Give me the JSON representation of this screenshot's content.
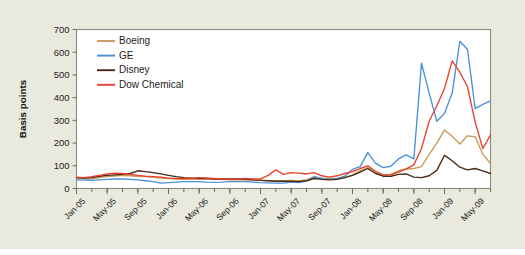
{
  "figure": {
    "background_color": "#e9e9dd",
    "plot_background_color": "#ffffff",
    "frame_color": "#8a8a80"
  },
  "chart_data": {
    "type": "line",
    "title": "",
    "xlabel": "",
    "ylabel": "Basis points",
    "ylim": [
      0,
      700
    ],
    "yticks": [
      0,
      100,
      200,
      300,
      400,
      500,
      600,
      700
    ],
    "ytick_labels": [
      "0",
      "100",
      "200",
      "300",
      "400",
      "500",
      "600",
      "700"
    ],
    "grid": false,
    "legend_position": "upper-left",
    "xtick_labels": [
      "Jan-05",
      "May-05",
      "Sep-05",
      "Jan-06",
      "May-06",
      "Sep-06",
      "Jan-07",
      "May-07",
      "Sep-07",
      "Jan-08",
      "May-08",
      "Sep-08",
      "Jan-09",
      "May-09"
    ],
    "xtick_indices": [
      0,
      4,
      8,
      12,
      16,
      20,
      24,
      28,
      32,
      36,
      40,
      44,
      48,
      52
    ],
    "x": [
      "Jan-05",
      "Feb-05",
      "Mar-05",
      "Apr-05",
      "May-05",
      "Jun-05",
      "Jul-05",
      "Aug-05",
      "Sep-05",
      "Oct-05",
      "Nov-05",
      "Dec-05",
      "Jan-06",
      "Feb-06",
      "Mar-06",
      "Apr-06",
      "May-06",
      "Jun-06",
      "Jul-06",
      "Aug-06",
      "Sep-06",
      "Oct-06",
      "Nov-06",
      "Dec-06",
      "Jan-07",
      "Feb-07",
      "Mar-07",
      "Apr-07",
      "May-07",
      "Jun-07",
      "Jul-07",
      "Aug-07",
      "Sep-07",
      "Oct-07",
      "Nov-07",
      "Dec-07",
      "Jan-08",
      "Feb-08",
      "Mar-08",
      "Apr-08",
      "May-08",
      "Jun-08",
      "Jul-08",
      "Aug-08",
      "Sep-08",
      "Oct-08",
      "Nov-08",
      "Dec-08",
      "Jan-09",
      "Feb-09",
      "Mar-09",
      "Apr-09",
      "May-09",
      "Jun-09",
      "Jul-09"
    ],
    "series": [
      {
        "name": "Boeing",
        "color": "#c99a5c",
        "values": [
          46,
          44,
          42,
          48,
          52,
          55,
          58,
          56,
          54,
          52,
          50,
          46,
          44,
          42,
          40,
          40,
          42,
          43,
          42,
          40,
          38,
          38,
          38,
          37,
          36,
          35,
          34,
          34,
          36,
          34,
          38,
          50,
          46,
          44,
          44,
          48,
          60,
          78,
          92,
          70,
          58,
          62,
          78,
          86,
          88,
          96,
          150,
          200,
          258,
          230,
          196,
          232,
          228,
          150,
          110
        ]
      },
      {
        "name": "GE",
        "color": "#4a90d9",
        "values": [
          38,
          37,
          36,
          38,
          40,
          42,
          42,
          40,
          38,
          34,
          30,
          24,
          26,
          28,
          30,
          30,
          30,
          28,
          27,
          28,
          30,
          30,
          30,
          28,
          26,
          25,
          24,
          24,
          28,
          26,
          34,
          52,
          44,
          40,
          44,
          54,
          84,
          96,
          158,
          112,
          92,
          98,
          130,
          148,
          130,
          552,
          420,
          296,
          330,
          420,
          648,
          612,
          352,
          370,
          386
        ]
      },
      {
        "name": "Disney",
        "color": "#4a2a14",
        "values": [
          48,
          46,
          48,
          54,
          58,
          60,
          62,
          66,
          78,
          74,
          70,
          64,
          58,
          52,
          48,
          46,
          44,
          44,
          42,
          42,
          42,
          42,
          40,
          38,
          36,
          34,
          32,
          32,
          32,
          30,
          34,
          44,
          40,
          38,
          40,
          48,
          58,
          72,
          88,
          66,
          54,
          54,
          62,
          64,
          50,
          48,
          56,
          80,
          146,
          122,
          94,
          82,
          88,
          78,
          66
        ]
      },
      {
        "name": "Dow Chemical",
        "color": "#e8412b",
        "values": [
          50,
          48,
          52,
          58,
          64,
          68,
          66,
          62,
          58,
          54,
          52,
          50,
          46,
          44,
          44,
          44,
          48,
          46,
          44,
          42,
          40,
          42,
          44,
          42,
          42,
          58,
          82,
          62,
          70,
          68,
          64,
          70,
          56,
          50,
          56,
          66,
          74,
          88,
          100,
          76,
          60,
          60,
          72,
          86,
          104,
          176,
          296,
          364,
          440,
          562,
          512,
          448,
          292,
          176,
          236
        ]
      }
    ]
  },
  "legend": {
    "items": [
      {
        "label": "Boeing",
        "color": "#c99a5c"
      },
      {
        "label": "GE",
        "color": "#4a90d9"
      },
      {
        "label": "Disney",
        "color": "#4a2a14"
      },
      {
        "label": "Dow Chemical",
        "color": "#e8412b"
      }
    ]
  }
}
